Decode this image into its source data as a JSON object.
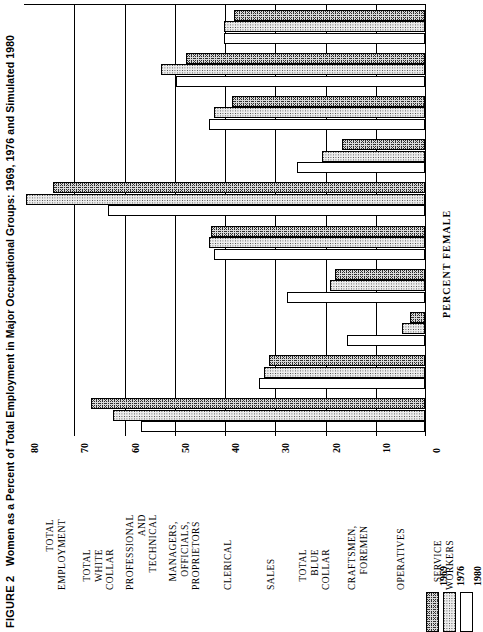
{
  "figure": {
    "number": "FIGURE 2",
    "title": "Women as a Percent of Total Employment in Major Occupational Groups: 1969, 1976 and Simulated 1980"
  },
  "axis": {
    "title": "PERCENT FEMALE",
    "ticks": [
      "0",
      "10",
      "20",
      "30",
      "40",
      "50",
      "60",
      "70",
      "80"
    ]
  },
  "legend": {
    "items": [
      {
        "label": "1969",
        "swatch": "stipple-dark"
      },
      {
        "label": "1976",
        "swatch": "stipple-light"
      },
      {
        "label": "1980",
        "swatch": "white"
      }
    ]
  },
  "chart_data": {
    "type": "bar",
    "orientation": "horizontal",
    "title": "Women as a Percent of Total Employment in Major Occupational Groups: 1969, 1976 and Simulated 1980",
    "xlabel": "PERCENT FEMALE",
    "ylabel": "",
    "xlim": [
      0,
      80
    ],
    "grid": true,
    "legend_position": "bottom-right",
    "categories": [
      "TOTAL EMPLOYMENT",
      "TOTAL WHITE COLLAR",
      "PROFESSIONAL AND TECHNICAL",
      "MANAGERS, OFFICIALS, PROPRIETORS",
      "CLERICAL",
      "SALES",
      "TOTAL BLUE COLLAR",
      "CRAFTSMEN, FOREMEN",
      "OPERATIVES",
      "SERVICE WORKERS"
    ],
    "category_lines": [
      [
        "TOTAL",
        "EMPLOYMENT"
      ],
      [
        "TOTAL",
        "WHITE",
        "COLLAR"
      ],
      [
        "PROFESSIONAL",
        "AND",
        "TECHNICAL"
      ],
      [
        "MANAGERS,",
        "OFFICIALS,",
        "PROPRIETORS"
      ],
      [
        "CLERICAL"
      ],
      [
        "SALES"
      ],
      [
        "TOTAL",
        "BLUE",
        "COLLAR"
      ],
      [
        "CRAFTSMEN,",
        "FOREMEN"
      ],
      [
        "OPERATIVES"
      ],
      [
        "SERVICE",
        "WORKERS"
      ]
    ],
    "series": [
      {
        "name": "1969",
        "values": [
          38.0,
          47.5,
          38.5,
          16.5,
          74.0,
          42.5,
          18.0,
          3.0,
          31.0,
          66.5
        ]
      },
      {
        "name": "1976",
        "values": [
          40.0,
          52.5,
          42.0,
          20.5,
          79.5,
          43.0,
          19.0,
          4.5,
          32.0,
          62.0
        ]
      },
      {
        "name": "1980",
        "values": [
          40.0,
          49.5,
          43.0,
          25.5,
          63.0,
          42.0,
          27.5,
          15.5,
          33.0,
          56.5
        ]
      }
    ]
  }
}
